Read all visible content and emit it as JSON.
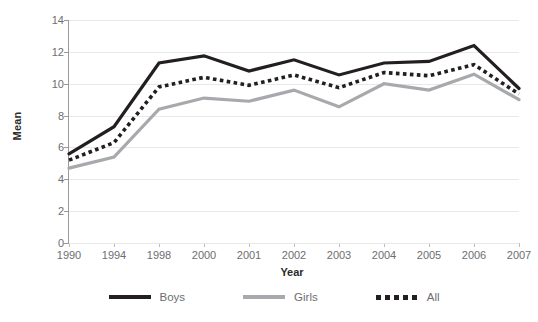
{
  "chart_data": {
    "type": "line",
    "title": "",
    "xlabel": "Year",
    "ylabel": "Mean",
    "categories": [
      "1990",
      "1994",
      "1998",
      "2000",
      "2001",
      "2002",
      "2003",
      "2004",
      "2005",
      "2006",
      "2007"
    ],
    "ylim": [
      0,
      14
    ],
    "yticks": [
      0,
      2,
      4,
      6,
      8,
      10,
      12,
      14
    ],
    "grid": true,
    "legend_position": "bottom",
    "series": [
      {
        "name": "Boys",
        "style": "solid",
        "color": "#231f20",
        "values": [
          5.6,
          7.3,
          11.3,
          11.75,
          10.8,
          11.5,
          10.55,
          11.3,
          11.4,
          12.4,
          9.7
        ]
      },
      {
        "name": "Girls",
        "style": "solid",
        "color": "#a7a9ac",
        "values": [
          4.7,
          5.4,
          8.4,
          9.1,
          8.9,
          9.6,
          8.55,
          10.0,
          9.6,
          10.6,
          9.0
        ]
      },
      {
        "name": "All",
        "style": "dotted",
        "color": "#231f20",
        "values": [
          5.2,
          6.3,
          9.8,
          10.4,
          9.9,
          10.55,
          9.75,
          10.7,
          10.5,
          11.2,
          9.35
        ]
      }
    ]
  },
  "legend": {
    "items": [
      {
        "label": "Boys",
        "swatch": "solid-line-dark-icon"
      },
      {
        "label": "Girls",
        "swatch": "solid-line-gray-icon"
      },
      {
        "label": "All",
        "swatch": "dotted-line-dark-icon"
      }
    ]
  },
  "axes": {
    "y_title": "Mean",
    "x_title": "Year"
  }
}
